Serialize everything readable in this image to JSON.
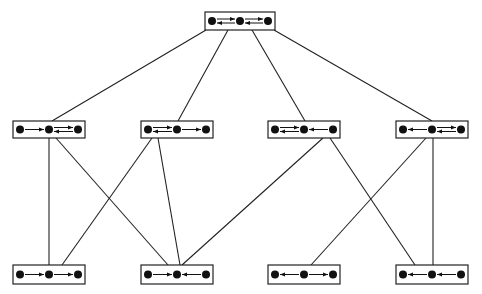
{
  "diagram": {
    "title": "",
    "colors": {
      "line": "#222222",
      "dot": "#111111",
      "background": "#ffffff"
    },
    "nodes": [
      {
        "id": "top",
        "row": 0,
        "x": 205,
        "y": 12,
        "w": 70,
        "h": 18,
        "links": [
          "both",
          "both"
        ]
      },
      {
        "id": "m1",
        "row": 1,
        "x": 13,
        "y": 121,
        "w": 72,
        "h": 17,
        "links": [
          "right",
          "both"
        ]
      },
      {
        "id": "m2",
        "row": 1,
        "x": 141,
        "y": 121,
        "w": 72,
        "h": 17,
        "links": [
          "both",
          "right"
        ]
      },
      {
        "id": "m3",
        "row": 1,
        "x": 268,
        "y": 121,
        "w": 72,
        "h": 17,
        "links": [
          "both",
          "left"
        ]
      },
      {
        "id": "m4",
        "row": 1,
        "x": 396,
        "y": 121,
        "w": 72,
        "h": 17,
        "links": [
          "left",
          "both"
        ]
      },
      {
        "id": "b1",
        "row": 2,
        "x": 13,
        "y": 265,
        "w": 72,
        "h": 19,
        "links": [
          "right",
          "right"
        ]
      },
      {
        "id": "b2",
        "row": 2,
        "x": 141,
        "y": 265,
        "w": 72,
        "h": 19,
        "links": [
          "right",
          "left"
        ]
      },
      {
        "id": "b3",
        "row": 2,
        "x": 268,
        "y": 265,
        "w": 72,
        "h": 19,
        "links": [
          "left",
          "right"
        ]
      },
      {
        "id": "b4",
        "row": 2,
        "x": 396,
        "y": 265,
        "w": 72,
        "h": 19,
        "links": [
          "left",
          "left"
        ]
      }
    ],
    "edges": [
      {
        "from": "top",
        "to": "m1",
        "x1": 206,
        "y1": 30,
        "x2": 52,
        "y2": 121
      },
      {
        "from": "top",
        "to": "m2",
        "x1": 228,
        "y1": 30,
        "x2": 178,
        "y2": 121
      },
      {
        "from": "top",
        "to": "m3",
        "x1": 252,
        "y1": 30,
        "x2": 305,
        "y2": 121
      },
      {
        "from": "top",
        "to": "m4",
        "x1": 274,
        "y1": 30,
        "x2": 432,
        "y2": 121
      },
      {
        "from": "m1",
        "to": "b1",
        "x1": 49,
        "y1": 138,
        "x2": 49,
        "y2": 265
      },
      {
        "from": "m1",
        "to": "b3",
        "x1": 56,
        "y1": 138,
        "x2": 168,
        "y2": 265
      },
      {
        "from": "m2",
        "to": "b1",
        "x1": 152,
        "y1": 138,
        "x2": 62,
        "y2": 265
      },
      {
        "from": "m2",
        "to": "b2",
        "x1": 158,
        "y1": 138,
        "x2": 180,
        "y2": 265
      },
      {
        "from": "m3",
        "to": "b2",
        "x1": 323,
        "y1": 138,
        "x2": 182,
        "y2": 265
      },
      {
        "from": "m3",
        "to": "b4",
        "x1": 330,
        "y1": 138,
        "x2": 415,
        "y2": 265
      },
      {
        "from": "m4",
        "to": "b3",
        "x1": 426,
        "y1": 138,
        "x2": 311,
        "y2": 265
      },
      {
        "from": "m4",
        "to": "b4",
        "x1": 433,
        "y1": 138,
        "x2": 433,
        "y2": 265
      }
    ]
  }
}
